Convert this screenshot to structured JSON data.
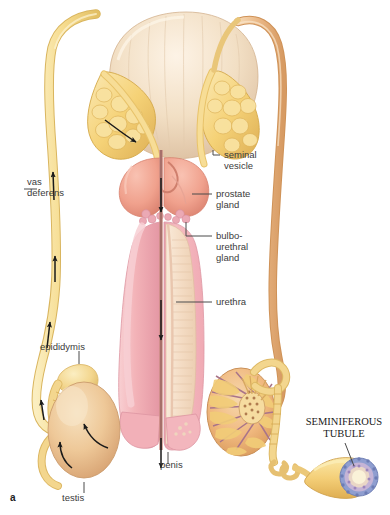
{
  "figure": {
    "panel_letter": "a",
    "background_color": "#ffffff"
  },
  "labels": {
    "vas_deferens": "vas\ndeferens",
    "epididymis": "epididymis",
    "testis": "testis",
    "penis": "penis",
    "seminal_vesicle": "seminal\nvesicle",
    "prostate_gland": "prostate\ngland",
    "bulbourethral_gland": "bulbo-\nurethral\ngland",
    "urethra": "urethra",
    "seminiferous_tubule": "SEMINIFEROUS\nTUBULE"
  },
  "colors": {
    "bladder": "#f3e0c6",
    "bladder_shade": "#e0c4a6",
    "seminal_vesicle": "#f5d277",
    "seminal_vesicle_dark": "#e0b457",
    "prostate": "#f0a18d",
    "prostate_dark": "#dd8472",
    "bulbourethral": "#eba9b4",
    "penis_shaft": "#f3b3b8",
    "penis_shaft_dark": "#e090a0",
    "urethra_channel": "#f7e4d3",
    "vas_deferens_left": "#f6dc8f",
    "vas_deferens_right": "#eab887",
    "testis_left": "#eec898",
    "testis_cut": "#f0b87e",
    "testis_lobule": "#f2cd78",
    "testis_septa": "#a8748a",
    "epididymis": "#f6dc9a",
    "tubule_body": "#f4cf78",
    "tubule_ring": "#8f9ed0",
    "tubule_lumen": "#faf2d8",
    "leader_line": "#4a4a4a",
    "arrow": "#1a1a1a",
    "label_text": "#3b3b3b"
  },
  "flow_arrows": {
    "count": 9,
    "meaning": "sperm pathway direction"
  }
}
